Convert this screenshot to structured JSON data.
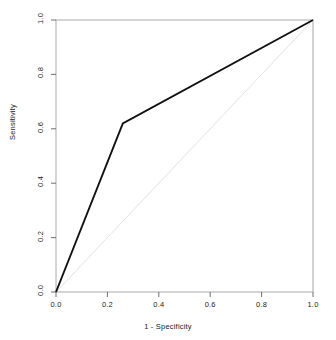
{
  "chart_data": {
    "type": "line",
    "title": "",
    "xlabel": "1 - Specificity",
    "ylabel": "Sensitivity",
    "xlim": [
      0.0,
      1.0
    ],
    "ylim": [
      0.0,
      1.0
    ],
    "grid": false,
    "legend": "none",
    "xticks": [
      "0.0",
      "0.2",
      "0.4",
      "0.6",
      "0.8",
      "1.0"
    ],
    "xtick_values": [
      0.0,
      0.2,
      0.4,
      0.6,
      0.8,
      1.0
    ],
    "yticks": [
      "0.0",
      "0.2",
      "0.4",
      "0.6",
      "0.8",
      "1.0"
    ],
    "ytick_values": [
      0.0,
      0.2,
      0.4,
      0.6,
      0.8,
      1.0
    ],
    "series": [
      {
        "name": "ROC curve",
        "color": "#111111",
        "width": 1.9,
        "x": [
          0.0,
          0.26,
          1.0
        ],
        "y": [
          0.0,
          0.62,
          1.0
        ]
      },
      {
        "name": "chance diagonal",
        "color": "#e2e2e2",
        "width": 1.0,
        "x": [
          0.0,
          1.0
        ],
        "y": [
          0.0,
          1.0
        ]
      }
    ]
  },
  "axes": {
    "box_color": "#b0b0b0",
    "tick_color": "#6e6e6e",
    "text_color": "#1a1a1a"
  }
}
